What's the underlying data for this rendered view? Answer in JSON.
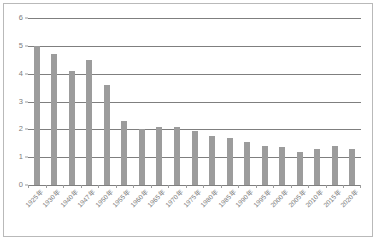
{
  "chart_data": {
    "type": "bar",
    "title": "",
    "subtitle": "",
    "xlabel": "",
    "ylabel": "",
    "ylim": [
      0,
      6
    ],
    "yticks": [
      0,
      1,
      2,
      3,
      4,
      5,
      6
    ],
    "ytick_labels": [
      "0",
      "1",
      "2",
      "3",
      "4",
      "5",
      "6"
    ],
    "grid": true,
    "legend": false,
    "legend_position": "none",
    "bar_color": "#9c9c9c",
    "gridline_color": "#7f7f7f",
    "axis_text_color": "#7c7c7c",
    "frame_color": "#b9b9b9",
    "background_color": "#ffffff",
    "categories": [
      "1925年",
      "1930年",
      "1940年",
      "1947年",
      "1950年",
      "1955年",
      "1960年",
      "1965年",
      "1970年",
      "1975年",
      "1980年",
      "1985年",
      "1990年",
      "1995年",
      "2000年",
      "2005年",
      "2010年",
      "2015年",
      "2020年"
    ],
    "values": [
      5.0,
      4.7,
      4.1,
      4.5,
      3.6,
      2.3,
      2.0,
      2.1,
      2.1,
      1.95,
      1.75,
      1.7,
      1.55,
      1.4,
      1.35,
      1.2,
      1.3,
      1.4,
      1.3
    ]
  }
}
